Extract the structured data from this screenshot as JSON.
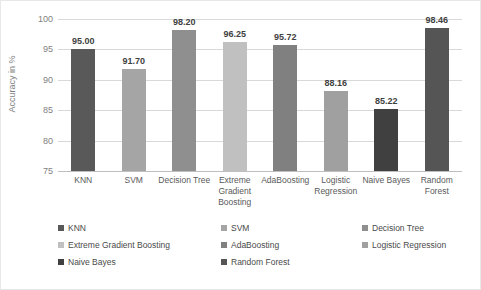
{
  "chart_data": {
    "type": "bar",
    "title": "",
    "xlabel": "",
    "ylabel": "Accuracy in %",
    "ylim": [
      75,
      100
    ],
    "yticks": [
      75,
      80,
      85,
      90,
      95,
      100
    ],
    "ytick_labels": [
      "75",
      "80",
      "85",
      "90",
      "95",
      "100"
    ],
    "grid": true,
    "legend_position": "bottom",
    "categories": [
      "KNN",
      "SVM",
      "Decision Tree",
      "Extreme Gradient Boosting",
      "AdaBoosting",
      "Logistic Regression",
      "Naive Bayes",
      "Random Forest"
    ],
    "values": [
      95.0,
      91.7,
      98.2,
      96.25,
      95.72,
      88.16,
      85.22,
      98.46
    ],
    "value_labels": [
      "95.00",
      "91.70",
      "98.20",
      "96.25",
      "95.72",
      "88.16",
      "85.22",
      "98.46"
    ],
    "colors": [
      "#595959",
      "#a5a5a5",
      "#8f8f8f",
      "#c0c0c0",
      "#808080",
      "#a0a0a0",
      "#404040",
      "#555555"
    ]
  },
  "axis": {
    "y_label": "Accuracy in %",
    "tick_labels": [
      "100",
      "95",
      "90",
      "85",
      "80",
      "75"
    ]
  },
  "categories_display": [
    "KNN",
    "SVM",
    "Decision Tree",
    "Extreme Gradient Boosting",
    "AdaBoosting",
    "Logistic Regression",
    "Naive Bayes",
    "Random Forest"
  ],
  "legend": {
    "rows": [
      [
        {
          "label": "KNN",
          "color": "#595959"
        },
        {
          "label": "SVM",
          "color": "#a5a5a5"
        },
        {
          "label": "Decision Tree",
          "color": "#8f8f8f"
        }
      ],
      [
        {
          "label": "Extreme Gradient Boosting",
          "color": "#c0c0c0"
        },
        {
          "label": "AdaBoosting",
          "color": "#808080"
        },
        {
          "label": "Logistic Regression",
          "color": "#a0a0a0"
        }
      ],
      [
        {
          "label": "Naive Bayes",
          "color": "#404040"
        },
        {
          "label": "Random Forest",
          "color": "#555555"
        }
      ]
    ]
  }
}
